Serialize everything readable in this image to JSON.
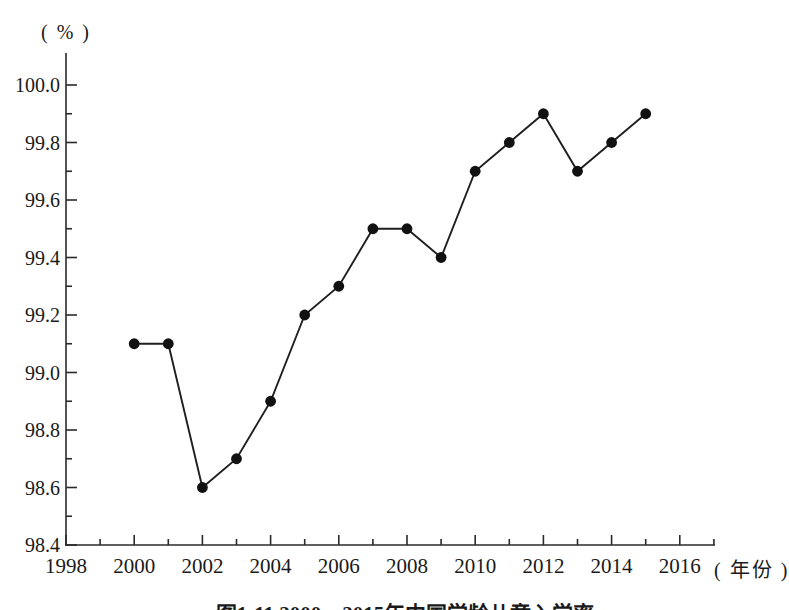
{
  "labels": {
    "y_unit": "( % )",
    "x_unit": "( 年份 )"
  },
  "caption": "图1-11  2000～2015年中国学龄儿童入学率",
  "chart_data": {
    "type": "line",
    "title": "图1-11 2000～2015年中国学龄儿童入学率",
    "xlabel": "(年份)",
    "ylabel": "(%)",
    "x": [
      2000,
      2001,
      2002,
      2003,
      2004,
      2005,
      2006,
      2007,
      2008,
      2009,
      2010,
      2011,
      2012,
      2013,
      2014,
      2015
    ],
    "values": [
      99.1,
      99.1,
      98.6,
      98.7,
      98.9,
      99.2,
      99.3,
      99.5,
      99.5,
      99.4,
      99.7,
      99.8,
      99.9,
      99.7,
      99.8,
      99.9
    ],
    "series_name": "学龄儿童入学率",
    "xlim": [
      1998,
      2017
    ],
    "ylim": [
      98.4,
      100.0
    ],
    "x_tick_labels": [
      "1998",
      "2000",
      "2002",
      "2004",
      "2006",
      "2008",
      "2010",
      "2012",
      "2014",
      "2016"
    ],
    "x_ticks": [
      1998,
      2000,
      2002,
      2004,
      2006,
      2008,
      2010,
      2012,
      2014,
      2016
    ],
    "x_minor_ticks": [
      1999,
      2001,
      2003,
      2005,
      2007,
      2009,
      2011,
      2013,
      2015,
      2017
    ],
    "y_tick_labels": [
      "98.4",
      "98.6",
      "98.8",
      "99.0",
      "99.2",
      "99.4",
      "99.6",
      "99.8",
      "100.0"
    ],
    "y_ticks": [
      98.4,
      98.6,
      98.8,
      99.0,
      99.2,
      99.4,
      99.6,
      99.8,
      100.0
    ],
    "y_minor_ticks": [
      98.5,
      98.7,
      98.9,
      99.1,
      99.3,
      99.5,
      99.7,
      99.9
    ],
    "grid": false,
    "legend": null,
    "marker": "filled-circle",
    "line_color": "#1f1f1f",
    "marker_color": "#111111",
    "axis_color": "#2a2a2a",
    "text_color": "#1a1a1a",
    "background_color": "#ffffff"
  }
}
